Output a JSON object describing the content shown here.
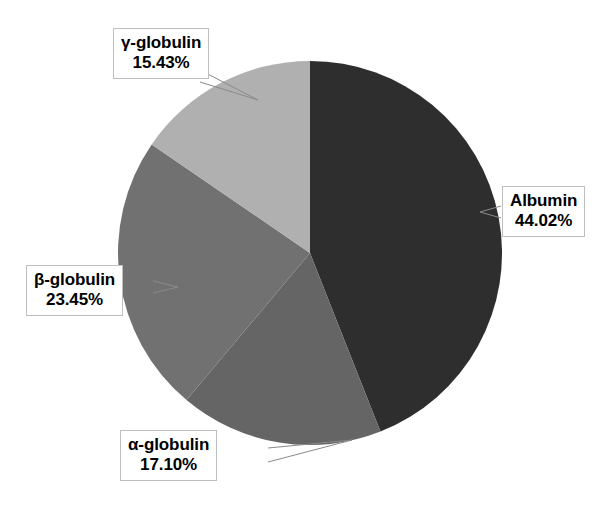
{
  "chart_data": {
    "type": "pie",
    "title": "",
    "subtitle": "",
    "xlabel": "",
    "ylabel": "",
    "legend_position": "none",
    "grid": false,
    "units": "percent",
    "start_angle_deg": 0,
    "direction": "clockwise",
    "categories": [
      "Albumin",
      "α-globulin",
      "β-globulin",
      "γ-globulin"
    ],
    "values": [
      44.02,
      17.1,
      23.45,
      15.43
    ],
    "value_labels": [
      "44.02%",
      "17.10%",
      "23.45%",
      "15.43%"
    ],
    "colors": [
      "#2e2e2e",
      "#656565",
      "#717171",
      "#b0b0b0"
    ],
    "slices": [
      {
        "name": "Albumin",
        "value": 44.02,
        "value_label": "44.02%",
        "color": "#2e2e2e",
        "start_deg": 0.0,
        "end_deg": 158.472
      },
      {
        "name": "α-globulin",
        "value": 17.1,
        "value_label": "17.10%",
        "color": "#656565",
        "start_deg": 158.472,
        "end_deg": 220.032
      },
      {
        "name": "β-globulin",
        "value": 23.45,
        "value_label": "23.45%",
        "color": "#717171",
        "start_deg": 220.032,
        "end_deg": 304.452
      },
      {
        "name": "γ-globulin",
        "value": 15.43,
        "value_label": "15.43%",
        "color": "#b0b0b0",
        "start_deg": 304.452,
        "end_deg": 360.0
      }
    ]
  },
  "callouts": {
    "albumin": {
      "name": "Albumin",
      "value": "44.02%"
    },
    "alpha": {
      "name": "α-globulin",
      "value": "17.10%"
    },
    "beta": {
      "name": "β-globulin",
      "value": "23.45%"
    },
    "gamma": {
      "name": "γ-globulin",
      "value": "15.43%"
    }
  },
  "geometry": {
    "center_x": 310,
    "center_y": 253,
    "radius": 192
  },
  "style": {
    "background": "#ffffff",
    "leader_line_color": "#8a8a8a",
    "callout_border": "#bfbfbf",
    "callout_background": "#ffffff",
    "text_color": "#000000"
  }
}
